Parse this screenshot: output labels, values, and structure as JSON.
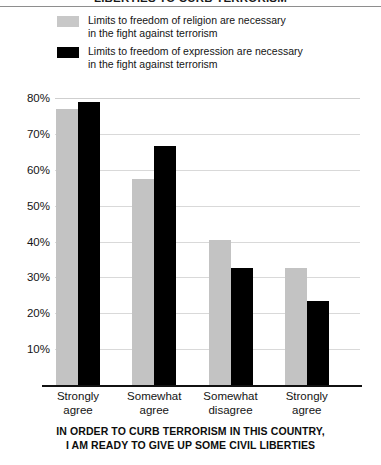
{
  "chart_data": {
    "type": "bar",
    "title": "LIBERTIES TO CURB TERRORISM",
    "subtitle": "",
    "xlabel": "IN ORDER TO CURB TERRORISM IN THIS COUNTRY, I AM READY TO GIVE UP SOME CIVIL LIBERTIES",
    "ylabel": "",
    "ylim": [
      0,
      85
    ],
    "ytick_values": [
      80,
      70,
      60,
      50,
      40,
      30,
      20,
      10
    ],
    "ytick_labels": [
      "80%",
      "70%",
      "60%",
      "50%",
      "40%",
      "30%",
      "20%",
      "10%"
    ],
    "grid": true,
    "legend_position": "top-left",
    "categories": [
      "Strongly agree",
      "Somewhat agree",
      "Somewhat disagree",
      "Strongly agree"
    ],
    "category_lines": [
      [
        "Strongly",
        "agree"
      ],
      [
        "Somewhat",
        "agree"
      ],
      [
        "Somewhat",
        "disagree"
      ],
      [
        "Strongly",
        "agree"
      ]
    ],
    "series": [
      {
        "name": "Limits to freedom of religion are necessary in the fight against terrorism",
        "name_lines": [
          "Limits to freedom of religion are necessary",
          "in the fight against terrorism"
        ],
        "color": "#c3c3c3",
        "values": [
          77,
          57.5,
          40.5,
          32.5
        ]
      },
      {
        "name": "Limits to freedom of expression are necessary in the fight against terrorism",
        "name_lines": [
          "Limits to freedom of expression are necessary",
          "in the fight against terrorism"
        ],
        "color": "#000000",
        "values": [
          79,
          66.5,
          32.5,
          23.5
        ]
      }
    ]
  },
  "chart": {
    "title_cut_off": "LIBERTIES TO CURB TERRORISM",
    "axis_title_line1": "IN ORDER TO CURB TERRORISM IN THIS COUNTRY,",
    "axis_title_line2": "I AM READY TO GIVE UP SOME CIVIL LIBERTIES"
  },
  "legend": {
    "items": [
      {
        "swatch": "gray-swatch",
        "line1": "Limits to freedom of religion are necessary",
        "line2": "in the fight against terrorism"
      },
      {
        "swatch": "black-swatch",
        "line1": "Limits to freedom of expression are necessary",
        "line2": "in the fight against terrorism"
      }
    ]
  },
  "yaxis": {
    "labels": [
      "80%",
      "70%",
      "60%",
      "50%",
      "40%",
      "30%",
      "20%",
      "10%"
    ]
  },
  "xaxis": {
    "groups": [
      {
        "line1": "Strongly",
        "line2": "agree"
      },
      {
        "line1": "Somewhat",
        "line2": "agree"
      },
      {
        "line1": "Somewhat",
        "line2": "disagree"
      },
      {
        "line1": "Strongly",
        "line2": "agree"
      }
    ]
  }
}
